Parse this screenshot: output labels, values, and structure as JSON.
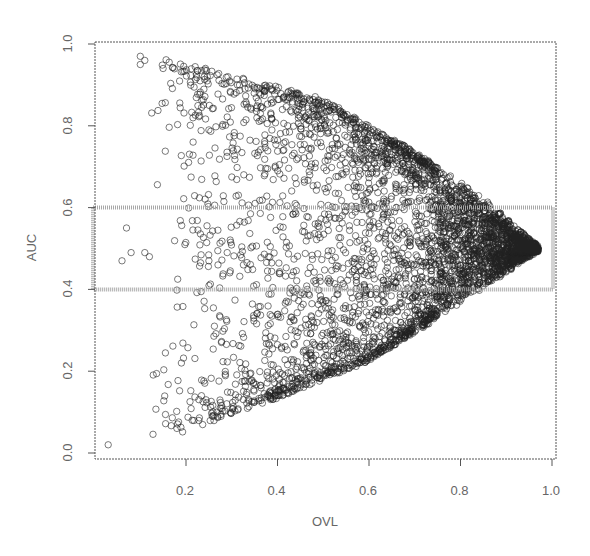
{
  "chart_data": {
    "type": "scatter",
    "title": "",
    "xlabel": "OVL",
    "ylabel": "AUC",
    "xlim": [
      0.0,
      1.0
    ],
    "ylim": [
      0.0,
      1.0
    ],
    "x_ticks": [
      "0.2",
      "0.4",
      "0.6",
      "0.8",
      "1.0"
    ],
    "y_ticks": [
      "0.0",
      "0.2",
      "0.4",
      "0.6",
      "0.8",
      "1.0"
    ],
    "grid": false,
    "legend": null,
    "marker": "open circle",
    "point_color": "#222222",
    "highlight_band": {
      "ymin": 0.4,
      "ymax": 0.6,
      "xmin": 0.0,
      "xmax": 1.0,
      "color": "#a8a8a8",
      "style": "stippled outline"
    },
    "distribution": {
      "description": "Wedge-shaped cloud: AUC spreads from ~0 to ~1 at low OVL and converges to 0.5 as OVL approaches 1; dense along upper and lower envelopes, sparser in the middle band at low OVL.",
      "upper_envelope": [
        [
          0.1,
          0.97
        ],
        [
          0.3,
          0.92
        ],
        [
          0.5,
          0.86
        ],
        [
          0.7,
          0.73
        ],
        [
          0.85,
          0.62
        ],
        [
          0.97,
          0.5
        ]
      ],
      "lower_envelope": [
        [
          0.03,
          0.02
        ],
        [
          0.2,
          0.06
        ],
        [
          0.4,
          0.14
        ],
        [
          0.6,
          0.23
        ],
        [
          0.8,
          0.37
        ],
        [
          0.97,
          0.5
        ]
      ],
      "approx_point_count": 4000
    },
    "notable_points": [
      {
        "x": 0.03,
        "y": 0.02
      },
      {
        "x": 0.1,
        "y": 0.97
      },
      {
        "x": 0.11,
        "y": 0.96
      },
      {
        "x": 0.1,
        "y": 0.95
      },
      {
        "x": 0.15,
        "y": 0.94
      },
      {
        "x": 0.07,
        "y": 0.55
      },
      {
        "x": 0.08,
        "y": 0.49
      },
      {
        "x": 0.06,
        "y": 0.47
      },
      {
        "x": 0.11,
        "y": 0.49
      },
      {
        "x": 0.12,
        "y": 0.48
      },
      {
        "x": 0.25,
        "y": 0.47
      },
      {
        "x": 0.27,
        "y": 0.46
      },
      {
        "x": 0.29,
        "y": 0.49
      },
      {
        "x": 0.38,
        "y": 0.48
      },
      {
        "x": 0.19,
        "y": 0.22
      },
      {
        "x": 0.25,
        "y": 0.79
      }
    ]
  }
}
